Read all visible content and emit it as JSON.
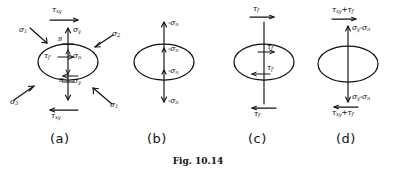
{
  "figure": {
    "caption": "Fig. 10.14",
    "panels": [
      {
        "id": "a",
        "caption": "(a)",
        "labels": {
          "top_shear": "τxy",
          "bottom_shear": "τxy",
          "top_normal": "σy",
          "bottom_normal": "σy",
          "inner_shear": "τf",
          "inner_normal": "σn",
          "principal_1_upper": "σ1",
          "principal_2": "σ2",
          "principal_3": "σ3",
          "principal_1_lower": "σ1",
          "point_upper": "B",
          "point_lower": "B'"
        }
      },
      {
        "id": "b",
        "caption": "(b)",
        "labels": {
          "top_outer": "-σn",
          "top_inner": "-σn",
          "bottom_inner": "-σn",
          "bottom_outer": "-σn"
        }
      },
      {
        "id": "c",
        "caption": "(c)",
        "labels": {
          "top_outer": "τf",
          "top_inner": "τf",
          "bottom_inner": "τf",
          "bottom_outer": "τf"
        }
      },
      {
        "id": "d",
        "caption": "(d)",
        "labels": {
          "top_shear_sum": "τxy+τf",
          "top_normal_diff": "σy-σn",
          "bottom_normal_diff": "σy-σn",
          "bottom_shear_sum": "τxy+τf"
        }
      }
    ]
  },
  "colors": {
    "ink": "#111111",
    "background": "#ffffff"
  }
}
